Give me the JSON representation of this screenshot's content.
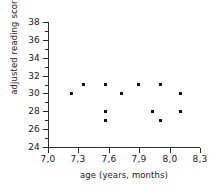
{
  "chart_data": {
    "type": "scatter",
    "title": "",
    "xlabel": "age (years, months)",
    "ylabel": "adjusted reading score",
    "xlim": [
      7.0,
      8.3
    ],
    "ylim": [
      24,
      38
    ],
    "grid": false,
    "legend": null,
    "x_tick_labels": [
      "7,0",
      "7,3",
      "7,6",
      "7,9",
      "8,0",
      "8,3"
    ],
    "x_tick_values": [
      7.0,
      7.3,
      7.6,
      7.9,
      8.0,
      8.3
    ],
    "y_tick_labels": [
      "24",
      "26",
      "28",
      "30",
      "32",
      "34",
      "36",
      "38"
    ],
    "y_tick_values": [
      24,
      26,
      28,
      30,
      32,
      34,
      36,
      38
    ],
    "y_minor_ticks": [
      25,
      27,
      29,
      31,
      33,
      35,
      37
    ],
    "points": [
      {
        "x": 7.2,
        "y": 30
      },
      {
        "x": 7.3,
        "y": 31
      },
      {
        "x": 7.49,
        "y": 31
      },
      {
        "x": 7.49,
        "y": 28
      },
      {
        "x": 7.49,
        "y": 27
      },
      {
        "x": 7.63,
        "y": 30
      },
      {
        "x": 7.77,
        "y": 31
      },
      {
        "x": 7.89,
        "y": 28
      },
      {
        "x": 7.96,
        "y": 31
      },
      {
        "x": 7.96,
        "y": 27
      },
      {
        "x": 8.13,
        "y": 30
      },
      {
        "x": 8.13,
        "y": 28
      },
      {
        "x": 7.3,
        "y": 31
      }
    ]
  }
}
